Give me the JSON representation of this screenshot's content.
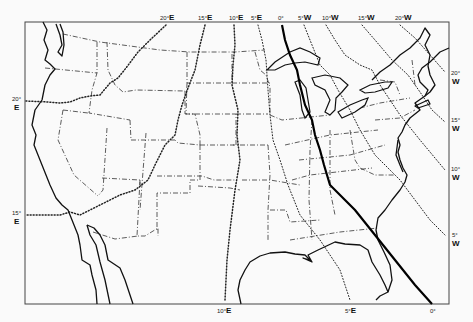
{
  "map": {
    "title": "Isogonic chart of the conterminous United States",
    "subject": "Magnetic declination lines",
    "colors": {
      "background": "#fafafa",
      "lines": "#111111"
    },
    "top_labels": [
      {
        "deg": "20°",
        "dir": "E",
        "x": 165
      },
      {
        "deg": "15°",
        "dir": "E",
        "x": 203
      },
      {
        "deg": "10°",
        "dir": "E",
        "x": 232
      },
      {
        "deg": "5°",
        "dir": "E",
        "x": 254
      },
      {
        "deg": "0°",
        "dir": "",
        "x": 281
      },
      {
        "deg": "5°",
        "dir": "W",
        "x": 302
      },
      {
        "deg": "10°",
        "dir": "W",
        "x": 323
      },
      {
        "deg": "15°",
        "dir": "W",
        "x": 360
      },
      {
        "deg": "20°",
        "dir": "W",
        "x": 397
      }
    ],
    "right_labels": [
      {
        "deg": "20°",
        "dir": "W",
        "y": 75
      },
      {
        "deg": "15°",
        "dir": "W",
        "y": 122
      },
      {
        "deg": "10°",
        "dir": "W",
        "y": 171
      },
      {
        "deg": "5°",
        "dir": "W",
        "y": 237
      }
    ],
    "left_labels": [
      {
        "deg": "20°",
        "dir": "E",
        "y": 101
      },
      {
        "deg": "15°",
        "dir": "E",
        "y": 215
      }
    ],
    "bottom_labels": [
      {
        "deg": "10°",
        "dir": "E",
        "x": 222
      },
      {
        "deg": "5°",
        "dir": "E",
        "x": 349
      },
      {
        "deg": "0°",
        "dir": "",
        "x": 432
      }
    ],
    "legend": {
      "agonic_line": "0° (agonic line, solid)",
      "isogonic_lines": "Dotted lines every 5° E/W"
    }
  }
}
